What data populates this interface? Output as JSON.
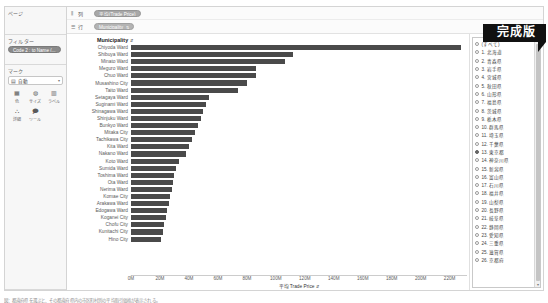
{
  "banner": {
    "label": "完成版"
  },
  "shelf": {
    "pages": {
      "title": "ページ"
    },
    "filters": {
      "title": "フィルター",
      "pill": "Code 2 : to Name (..."
    },
    "marks": {
      "title": "マーク",
      "type_label": "自動",
      "type_icon": "bar-chart-icon",
      "buttons": [
        {
          "label": "色",
          "icon": "color-icon"
        },
        {
          "label": "サイズ",
          "icon": "size-icon"
        },
        {
          "label": "ラベル",
          "icon": "label-icon"
        },
        {
          "label": "詳細",
          "icon": "detail-icon"
        },
        {
          "label": "ツール",
          "icon": "tooltip-icon"
        }
      ]
    }
  },
  "shelves": {
    "columns": {
      "label": "列",
      "icon": "columns-icon",
      "pill": "平均(Trade Price)"
    },
    "rows": {
      "label": "行",
      "icon": "rows-icon",
      "pill": "Municipality"
    }
  },
  "chart_data": {
    "type": "bar",
    "title": "Municipality",
    "orientation": "horizontal",
    "xlabel": "平均 Trade Price",
    "ylabel": "Municipality",
    "xlim": [
      0,
      232
    ],
    "xunit": "M",
    "grid": false,
    "legend": "none",
    "bar_color": "#4a4a4a",
    "tick_labels": [
      "0M",
      "20M",
      "40M",
      "60M",
      "80M",
      "100M",
      "120M",
      "140M",
      "160M",
      "180M",
      "200M",
      "220M"
    ],
    "tick_values": [
      0,
      20,
      40,
      60,
      80,
      100,
      120,
      140,
      160,
      180,
      200,
      220
    ],
    "categories": [
      "Chiyoda Ward",
      "Shibuya Ward",
      "Minato Ward",
      "Meguro Ward",
      "Chuo Ward",
      "Musashino City",
      "Taito Ward",
      "Setagaya Ward",
      "Suginami Ward",
      "Shinagawa Ward",
      "Shinjuku Ward",
      "Bunkyo Ward",
      "Mitaka City",
      "Tachikawa City",
      "Kita Ward",
      "Nakano Ward",
      "Koto Ward",
      "Sumida Ward",
      "Toshima Ward",
      "Ota Ward",
      "Nerima Ward",
      "Komae City",
      "Arakawa Ward",
      "Edogawa Ward",
      "Koganei City",
      "Chofu City",
      "Kunitachi City",
      "Hino City"
    ],
    "values": [
      228,
      112,
      106,
      86,
      86,
      80,
      74,
      54,
      52,
      50,
      48,
      46,
      44,
      42,
      40,
      38,
      33,
      31,
      30,
      29,
      28,
      27,
      26,
      25,
      24,
      23,
      22,
      21
    ]
  },
  "legend": {
    "all_label": "(すべて)",
    "selected_index": 13,
    "items": [
      "1. 北海道",
      "2. 青森県",
      "3. 岩手県",
      "4. 宮城県",
      "5. 秋田県",
      "6. 山形県",
      "7. 福島県",
      "8. 茨城県",
      "9. 栃木県",
      "10. 群馬県",
      "11. 埼玉県",
      "12. 千葉県",
      "13. 東京都",
      "14. 神奈川県",
      "15. 新潟県",
      "16. 富山県",
      "17. 石川県",
      "18. 福井県",
      "19. 山梨県",
      "20. 長野県",
      "21. 岐阜県",
      "22. 静岡県",
      "23. 愛知県",
      "24. 三重県",
      "25. 滋賀県",
      "26. 京都府"
    ]
  },
  "caption": {
    "text": "図：都道府県を選ぶと、その都道府県内の市区町村別の平均取引価格が表示される。"
  }
}
